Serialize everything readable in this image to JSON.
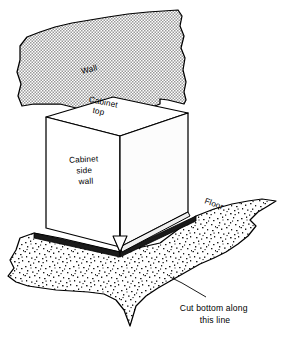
{
  "figure": {
    "type": "technical-line-illustration",
    "background_color": "#ffffff",
    "line_color": "#000000",
    "wall_fill_color": "#d8d8d8",
    "floor_fill_color": "#e2e2e2",
    "cabinet_front_color": "#ffffff",
    "cabinet_side_color": "#fafafa",
    "cabinet_top_color": "#ffffff",
    "cut_line_color": "#111111"
  },
  "labels": {
    "wall": "Wall",
    "cabinet_top_line1": "Cabinet",
    "cabinet_top_line2": "top",
    "cabinet_side_line1": "Cabinet",
    "cabinet_side_line2": "side",
    "cabinet_side_line3": "wall",
    "floor": "Floor"
  },
  "caption": {
    "line1": "Cut bottom along",
    "line2": "this line"
  },
  "annotations": {
    "arrow_name": "down-arrow-to-cut-line",
    "leader_name": "caption-leader-line"
  }
}
